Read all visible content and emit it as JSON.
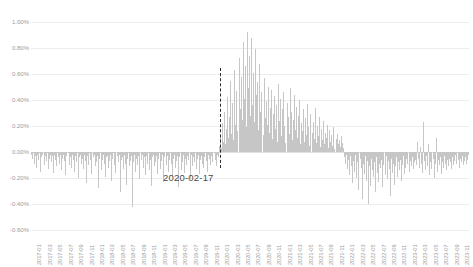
{
  "chart_data": {
    "type": "bar",
    "title": "",
    "xlabel": "",
    "ylabel": "",
    "ylim": [
      -0.6,
      1.0
    ],
    "ytick_labels": [
      "1.00%",
      "0.80%",
      "0.60%",
      "0.40%",
      "0.20%",
      "0.00%",
      "-0.20%",
      "-0.40%",
      "-0.60%"
    ],
    "ytick_values": [
      1.0,
      0.8,
      0.6,
      0.4,
      0.2,
      0.0,
      -0.2,
      -0.4,
      -0.6
    ],
    "grid": true,
    "legend": "none",
    "xtick_labels": [
      "2017-01",
      "2017-03",
      "2017-05",
      "2017-07",
      "2017-09",
      "2017-11",
      "2018-01",
      "2018-03",
      "2018-05",
      "2018-07",
      "2018-09",
      "2018-11",
      "2019-01",
      "2019-03",
      "2019-05",
      "2019-07",
      "2019-09",
      "2019-11",
      "2020-01",
      "2020-03",
      "2020-05",
      "2020-07",
      "2020-09",
      "2020-11",
      "2021-01",
      "2021-03",
      "2021-05",
      "2021-07",
      "2021-09",
      "2021-11",
      "2022-01",
      "2022-03",
      "2022-05",
      "2022-07",
      "2022-09",
      "2022-11",
      "2023-01",
      "2023-03",
      "2023-05",
      "2023-07",
      "2023-09",
      "2023-11"
    ],
    "annotations": [
      {
        "label": "2020-02-17",
        "x": "2020-02-17",
        "type": "vertical-dashed-line",
        "color": "#2b2b2b"
      }
    ],
    "bar_color": "#c6c6c6",
    "values": [
      -0.02,
      -0.05,
      -0.01,
      -0.09,
      -0.03,
      -0.12,
      -0.02,
      -0.06,
      -0.01,
      -0.15,
      -0.04,
      -0.02,
      -0.1,
      -0.03,
      -0.07,
      -0.01,
      -0.13,
      -0.05,
      -0.02,
      -0.08,
      -0.03,
      -0.16,
      -0.02,
      -0.06,
      -0.11,
      -0.01,
      -0.04,
      -0.09,
      -0.02,
      -0.14,
      -0.05,
      -0.02,
      -0.07,
      -0.18,
      -0.03,
      -0.01,
      -0.1,
      -0.04,
      -0.12,
      -0.02,
      -0.06,
      -0.15,
      -0.03,
      -0.08,
      -0.01,
      -0.2,
      -0.04,
      -0.02,
      -0.09,
      -0.05,
      -0.13,
      -0.02,
      -0.07,
      -0.24,
      -0.03,
      -0.1,
      -0.01,
      -0.06,
      -0.17,
      -0.04,
      -0.02,
      -0.11,
      -0.08,
      -0.03,
      -0.28,
      -0.05,
      -0.01,
      -0.14,
      -0.06,
      -0.02,
      -0.09,
      -0.19,
      -0.04,
      -0.03,
      -0.12,
      -0.07,
      -0.02,
      -0.22,
      -0.05,
      -0.01,
      -0.1,
      -0.16,
      -0.03,
      -0.08,
      -0.02,
      -0.31,
      -0.06,
      -0.04,
      -0.13,
      -0.02,
      -0.09,
      -0.25,
      -0.05,
      -0.01,
      -0.11,
      -0.07,
      -0.03,
      -0.42,
      -0.08,
      -0.02,
      -0.15,
      -0.05,
      -0.1,
      -0.03,
      -0.21,
      -0.06,
      -0.02,
      -0.12,
      -0.04,
      -0.18,
      -0.03,
      -0.09,
      -0.01,
      -0.14,
      -0.06,
      -0.26,
      -0.04,
      -0.02,
      -0.11,
      -0.08,
      -0.03,
      -0.17,
      -0.05,
      -0.01,
      -0.13,
      -0.07,
      -0.02,
      -0.23,
      -0.04,
      -0.1,
      -0.03,
      -0.15,
      -0.06,
      -0.01,
      -0.09,
      -0.19,
      -0.05,
      -0.02,
      -0.12,
      -0.07,
      -0.03,
      -0.27,
      -0.04,
      -0.01,
      -0.14,
      -0.08,
      -0.02,
      -0.16,
      -0.05,
      -0.1,
      -0.03,
      -0.06,
      -0.21,
      -0.02,
      -0.11,
      -0.04,
      -0.08,
      -0.01,
      -0.13,
      -0.05,
      -0.02,
      -0.17,
      -0.06,
      -0.03,
      -0.09,
      -0.12,
      -0.04,
      -0.01,
      -0.07,
      -0.15,
      -0.02,
      -0.05,
      -0.1,
      -0.03,
      -0.08,
      -0.01,
      -0.06,
      -0.11,
      -0.02,
      -0.04,
      0.05,
      0.12,
      0.03,
      0.22,
      0.08,
      0.31,
      0.06,
      0.18,
      0.42,
      0.11,
      0.27,
      0.55,
      0.14,
      0.38,
      0.09,
      0.63,
      0.21,
      0.47,
      0.16,
      0.72,
      0.33,
      0.58,
      0.25,
      0.85,
      0.41,
      0.66,
      0.19,
      0.92,
      0.49,
      0.74,
      0.28,
      0.88,
      0.36,
      0.61,
      0.23,
      0.79,
      0.44,
      0.54,
      0.17,
      0.68,
      0.31,
      0.46,
      0.13,
      0.57,
      0.26,
      0.39,
      0.21,
      0.5,
      0.15,
      0.34,
      0.48,
      0.1,
      0.29,
      0.43,
      0.18,
      0.36,
      0.08,
      0.52,
      0.24,
      0.41,
      0.12,
      0.33,
      0.46,
      0.2,
      0.07,
      0.38,
      0.27,
      0.14,
      0.49,
      0.31,
      0.09,
      0.25,
      0.44,
      0.17,
      0.35,
      0.11,
      0.28,
      0.4,
      0.06,
      0.22,
      0.16,
      0.33,
      0.08,
      0.26,
      0.13,
      0.37,
      0.19,
      0.05,
      0.29,
      0.15,
      0.23,
      0.1,
      0.34,
      0.07,
      0.2,
      0.12,
      0.27,
      0.04,
      0.18,
      0.09,
      0.24,
      0.06,
      0.15,
      0.11,
      0.21,
      0.03,
      0.17,
      0.08,
      0.13,
      0.05,
      0.19,
      0.02,
      0.1,
      0.14,
      0.06,
      0.09,
      0.04,
      0.12,
      0.07,
      0.03,
      -0.04,
      -0.09,
      -0.02,
      -0.13,
      -0.06,
      -0.18,
      -0.03,
      -0.11,
      -0.24,
      -0.07,
      -0.15,
      -0.02,
      -0.2,
      -0.08,
      -0.29,
      -0.05,
      -0.12,
      -0.36,
      -0.09,
      -0.17,
      -0.03,
      -0.22,
      -0.07,
      -0.4,
      -0.11,
      -0.26,
      -0.05,
      -0.14,
      -0.19,
      -0.08,
      -0.31,
      -0.04,
      -0.16,
      -0.23,
      -0.09,
      -0.12,
      -0.06,
      -0.27,
      -0.1,
      -0.18,
      -0.03,
      -0.21,
      -0.07,
      -0.13,
      -0.34,
      -0.05,
      -0.16,
      -0.09,
      -0.25,
      -0.11,
      -0.04,
      -0.19,
      -0.08,
      -0.14,
      -0.06,
      -0.22,
      -0.1,
      -0.03,
      -0.17,
      -0.12,
      -0.05,
      -0.09,
      -0.15,
      -0.07,
      -0.11,
      -0.04,
      -0.13,
      -0.08,
      -0.06,
      -0.1,
      0.08,
      -0.05,
      -0.12,
      0.04,
      -0.09,
      -0.16,
      0.23,
      -0.07,
      -0.14,
      -0.03,
      -0.11,
      0.06,
      -0.18,
      -0.08,
      -0.13,
      -0.05,
      -0.2,
      -0.09,
      0.11,
      -0.15,
      -0.06,
      -0.1,
      -0.04,
      -0.17,
      -0.08,
      -0.12,
      -0.03,
      -0.09,
      -0.14,
      -0.06,
      -0.11,
      -0.05,
      -0.08,
      -0.13,
      -0.04,
      -0.1,
      -0.07,
      -0.02,
      -0.09,
      -0.06,
      -0.12,
      -0.05,
      -0.08,
      -0.03,
      -0.1,
      -0.07,
      -0.04,
      -0.09,
      -0.06,
      -0.02
    ]
  }
}
